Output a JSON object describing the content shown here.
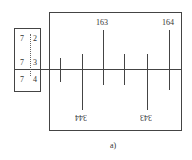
{
  "figure": {
    "caption": "a)",
    "small_scale": {
      "labels": [
        {
          "major": "7",
          "minor": "2"
        },
        {
          "major": "7",
          "minor": "3"
        },
        {
          "major": "7",
          "minor": "4"
        }
      ]
    },
    "large_scale": {
      "top_labels": [
        "163",
        "164"
      ],
      "bottom_labels": [
        "344",
        "343"
      ]
    }
  }
}
